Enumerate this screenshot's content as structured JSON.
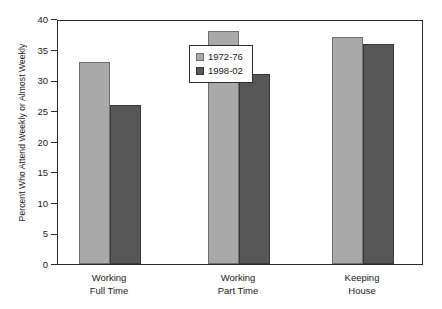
{
  "chart_data": {
    "type": "bar",
    "title": "",
    "xlabel": "",
    "ylabel": "Percent Who Attend Weekly or Almost Weekly",
    "ylim": [
      0,
      40
    ],
    "yticks": [
      0,
      5,
      10,
      15,
      20,
      25,
      30,
      35,
      40
    ],
    "ytick_labels": [
      "0",
      "5",
      "10",
      "15",
      "20",
      "25",
      "30",
      "35",
      "40"
    ],
    "grid": false,
    "legend_position": "inside-upper-center",
    "categories": [
      "Working Full Time",
      "Working Part Time",
      "Keeping House"
    ],
    "category_lines": [
      [
        "Working",
        "Full Time"
      ],
      [
        "Working",
        "Part Time"
      ],
      [
        "Keeping",
        "House"
      ]
    ],
    "series": [
      {
        "name": "1972-76",
        "color": "#a9a9a9",
        "values": [
          33,
          38,
          37
        ]
      },
      {
        "name": "1998-02",
        "color": "#575757",
        "values": [
          26,
          31,
          36
        ]
      }
    ]
  },
  "legend": {
    "items": [
      {
        "label": "1972-76"
      },
      {
        "label": "1998-02"
      }
    ]
  },
  "colors": {
    "series_1972_76": "#a9a9a9",
    "series_1998_02": "#575757",
    "axis": "#2b2b2b",
    "text": "#1a1a1a",
    "background": "#ffffff"
  }
}
